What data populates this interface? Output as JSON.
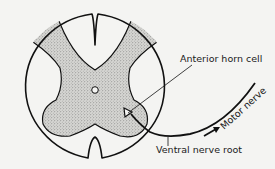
{
  "diagram": {
    "labels": {
      "anterior_horn_cell": "Anterior horn cell",
      "motor_nerve": "Motor nerve",
      "ventral_nerve_root": "Ventral nerve root"
    },
    "colors": {
      "background": "#f4f4f2",
      "outline": "#111111",
      "gray_matter": "#c9c9c6"
    }
  }
}
